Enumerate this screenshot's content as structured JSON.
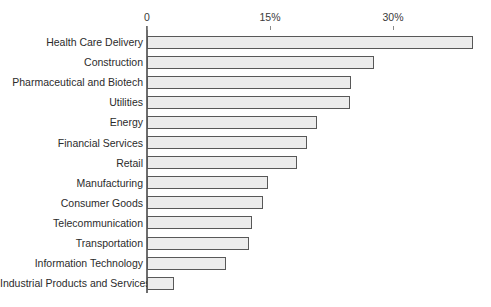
{
  "chart_data": {
    "type": "bar",
    "orientation": "horizontal",
    "title": "",
    "xlabel": "",
    "ylabel": "",
    "xlim": [
      0,
      36
    ],
    "grid": false,
    "legend": null,
    "tick_labels": [
      "0",
      "15%",
      "30%"
    ],
    "tick_values": [
      0,
      15,
      30
    ],
    "categories": [
      "Health Care Delivery",
      "Construction",
      "Pharmaceutical and Biotech",
      "Utilities",
      "Energy",
      "Financial Services",
      "Retail",
      "Manufacturing",
      "Consumer Goods",
      "Telecommunication",
      "Transportation",
      "Information Technology",
      "Industrial Products and Services"
    ],
    "values": [
      39.8,
      27.7,
      24.9,
      24.8,
      20.7,
      19.5,
      18.3,
      14.8,
      14.2,
      12.8,
      12.4,
      9.6,
      3.3
    ],
    "bar_fill": "#ececec",
    "bar_border": "#585858",
    "axis_color": "#6e6e6e"
  },
  "axis": {
    "ticks": [
      {
        "label": "0",
        "value": 0
      },
      {
        "label": "15%",
        "value": 15
      },
      {
        "label": "30%",
        "value": 30
      }
    ]
  },
  "bars": [
    {
      "label": "Health Care Delivery",
      "value": 39.8
    },
    {
      "label": "Construction",
      "value": 27.7
    },
    {
      "label": "Pharmaceutical and Biotech",
      "value": 24.9
    },
    {
      "label": "Utilities",
      "value": 24.8
    },
    {
      "label": "Energy",
      "value": 20.7
    },
    {
      "label": "Financial Services",
      "value": 19.5
    },
    {
      "label": "Retail",
      "value": 18.3
    },
    {
      "label": "Manufacturing",
      "value": 14.8
    },
    {
      "label": "Consumer Goods",
      "value": 14.2
    },
    {
      "label": "Telecommunication",
      "value": 12.8
    },
    {
      "label": "Transportation",
      "value": 12.4
    },
    {
      "label": "Information Technology",
      "value": 9.6
    },
    {
      "label": "Industrial Products and Services",
      "value": 3.3
    }
  ]
}
